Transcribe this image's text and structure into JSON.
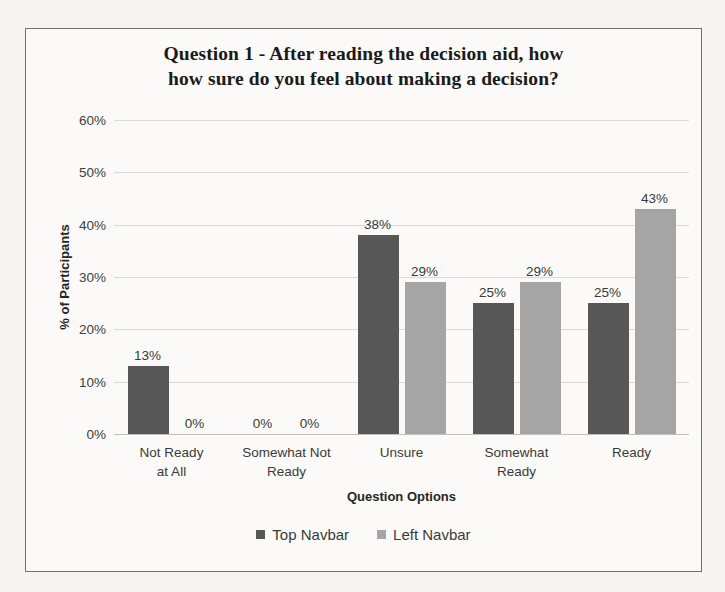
{
  "chart_data": {
    "type": "bar",
    "title": "Question 1 - After reading the decision aid, how how sure do you feel about making a decision?",
    "title_line1": "Question 1 - After reading the decision aid, how",
    "title_line2": "how sure do you feel about making a decision?",
    "xlabel": "Question Options",
    "ylabel": "% of Participants",
    "ylim": [
      0,
      60
    ],
    "ytick_labels": [
      "60%",
      "50%",
      "40%",
      "30%",
      "20%",
      "10%",
      "0%"
    ],
    "ytick_values": [
      60,
      50,
      40,
      30,
      20,
      10,
      0
    ],
    "grid": true,
    "legend_position": "bottom",
    "categories": [
      "Not Ready at All",
      "Somewhat Not Ready",
      "Unsure",
      "Somewhat Ready",
      "Ready"
    ],
    "category_lines": [
      [
        "Not Ready",
        "at All"
      ],
      [
        "Somewhat Not",
        "Ready"
      ],
      [
        "Unsure"
      ],
      [
        "Somewhat",
        "Ready"
      ],
      [
        "Ready"
      ]
    ],
    "series": [
      {
        "name": "Top Navbar",
        "color": "#575757",
        "values": [
          13,
          0,
          38,
          25,
          25
        ],
        "labels": [
          "13%",
          "0%",
          "38%",
          "25%",
          "25%"
        ]
      },
      {
        "name": "Left Navbar",
        "color": "#a5a5a5",
        "values": [
          0,
          0,
          29,
          29,
          43
        ],
        "labels": [
          "0%",
          "0%",
          "29%",
          "29%",
          "43%"
        ]
      }
    ]
  },
  "colors": {
    "series_top_navbar": "#575757",
    "series_left_navbar": "#a5a5a5",
    "gridline": "#d9d9d9",
    "frame_border": "#6f6f6f",
    "page_background": "#f6f4f1",
    "plot_background": "#fbfaf8"
  }
}
